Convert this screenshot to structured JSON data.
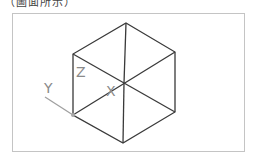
{
  "caption": {
    "text": "（圖面所示）",
    "note": "partially cut off at top edge"
  },
  "diagram": {
    "type": "isometric-cube-wireframe",
    "line_color": "#3a3a3a",
    "axis_color": "#9a9a9a",
    "frame_color": "#c4c4c4",
    "vertices": {
      "top": [
        126,
        23
      ],
      "upper_right": [
        175,
        52
      ],
      "lower_right": [
        175,
        112
      ],
      "bottom": [
        123,
        143
      ],
      "lower_left": [
        73,
        115
      ],
      "upper_left": [
        73,
        54
      ],
      "center": [
        124,
        83
      ]
    },
    "axis_labels": {
      "x": "X",
      "y": "Y",
      "z": "Z"
    }
  }
}
